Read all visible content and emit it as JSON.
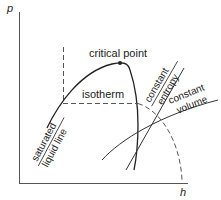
{
  "diagram": {
    "type": "pressure-enthalpy diagram",
    "axes": {
      "y_label": "p",
      "x_label": "h"
    },
    "labels": {
      "critical_point": "critical point",
      "isotherm": "isotherm",
      "saturated_line1": "saturated",
      "saturated_line2": "liquid line",
      "entropy_line1": "constant",
      "entropy_line2": "entropy",
      "volume_line1": "constant",
      "volume_line2": "volume"
    },
    "colors": {
      "line": "#222222",
      "dashed": "#555555",
      "axis": "#444444"
    }
  }
}
